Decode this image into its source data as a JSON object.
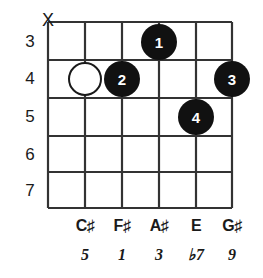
{
  "diagram": {
    "type": "guitar-chord-diagram",
    "colors": {
      "grid": "#333333",
      "dot_fill": "#111111",
      "dot_text": "#ffffff",
      "open_dot_fill": "#ffffff",
      "text": "#1a1a1a",
      "background": "#ffffff"
    },
    "fret_numbers": [
      "3",
      "4",
      "5",
      "6",
      "7"
    ],
    "string_count": 6,
    "fret_count": 5,
    "mute_markers": [
      {
        "string": 6,
        "symbol": "X"
      }
    ],
    "open_markers": [
      {
        "string": 5,
        "fret": 4
      }
    ],
    "finger_dots": [
      {
        "label": "1",
        "string": 3,
        "fret": 3
      },
      {
        "label": "2",
        "string": 4,
        "fret": 4
      },
      {
        "label": "3",
        "string": 1,
        "fret": 4
      },
      {
        "label": "4",
        "string": 2,
        "fret": 5
      }
    ],
    "note_names": [
      "C♯",
      "F♯",
      "A♯",
      "E",
      "G♯"
    ],
    "intervals": [
      "5",
      "1",
      "3",
      "♭7",
      "9"
    ]
  }
}
